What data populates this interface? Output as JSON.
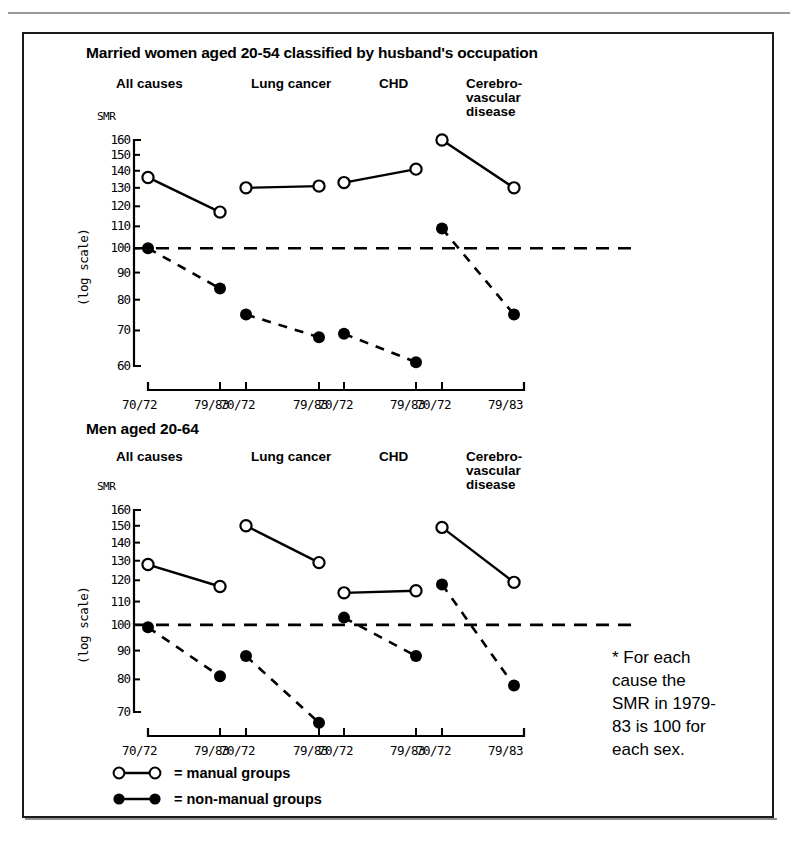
{
  "figure": {
    "footnote": "* For each\ncause the\nSMR in 1979-\n83 is 100 for\neach sex."
  },
  "legend": {
    "manual": "= manual groups",
    "non_manual": "= non-manual groups"
  },
  "axis": {
    "smr_label": "SMR",
    "log_scale_label": "(log scale)",
    "x_ticks": [
      "70/72",
      "79/83"
    ]
  },
  "chart_data": [
    {
      "type": "line",
      "title": "Married women aged 20-54 classified by husband's occupation",
      "xlabel": "",
      "ylabel": "SMR (log scale)",
      "yscale": "log",
      "ylim": [
        60,
        160
      ],
      "yticks": [
        60,
        70,
        80,
        90,
        100,
        110,
        120,
        130,
        140,
        150,
        160
      ],
      "grid": false,
      "reference_line": 100,
      "categories": [
        "All causes",
        "Lung cancer",
        "CHD",
        "Cerebro-vascular disease"
      ],
      "x": [
        "70/72",
        "79/83"
      ],
      "series": [
        {
          "name": "manual groups",
          "marker": "open-circle",
          "linestyle": "solid",
          "groups": [
            {
              "category": "All causes",
              "values": [
                136,
                117
              ]
            },
            {
              "category": "Lung cancer",
              "values": [
                130,
                131
              ]
            },
            {
              "category": "CHD",
              "values": [
                133,
                141
              ]
            },
            {
              "category": "Cerebro-vascular disease",
              "values": [
                160,
                130
              ]
            }
          ]
        },
        {
          "name": "non-manual groups",
          "marker": "filled-circle",
          "linestyle": "dashed",
          "groups": [
            {
              "category": "All causes",
              "values": [
                100,
                84
              ]
            },
            {
              "category": "Lung cancer",
              "values": [
                75,
                68
              ]
            },
            {
              "category": "CHD",
              "values": [
                69,
                61
              ]
            },
            {
              "category": "Cerebro-vascular disease",
              "values": [
                109,
                75
              ]
            }
          ]
        }
      ]
    },
    {
      "type": "line",
      "title": "Men aged 20-64",
      "xlabel": "",
      "ylabel": "SMR (log scale)",
      "yscale": "log",
      "ylim": [
        70,
        160
      ],
      "yticks": [
        70,
        80,
        90,
        100,
        110,
        120,
        130,
        140,
        150,
        160
      ],
      "grid": false,
      "reference_line": 100,
      "categories": [
        "All causes",
        "Lung cancer",
        "CHD",
        "Cerebro-vascular disease"
      ],
      "x": [
        "70/72",
        "79/83"
      ],
      "series": [
        {
          "name": "manual groups",
          "marker": "open-circle",
          "linestyle": "solid",
          "groups": [
            {
              "category": "All causes",
              "values": [
                128,
                117
              ]
            },
            {
              "category": "Lung cancer",
              "values": [
                150,
                129
              ]
            },
            {
              "category": "CHD",
              "values": [
                114,
                115
              ]
            },
            {
              "category": "Cerebro-vascular disease",
              "values": [
                149,
                119
              ]
            }
          ]
        },
        {
          "name": "non-manual groups",
          "marker": "filled-circle",
          "linestyle": "dashed",
          "groups": [
            {
              "category": "All causes",
              "values": [
                99,
                81
              ]
            },
            {
              "category": "Lung cancer",
              "values": [
                88,
                67
              ]
            },
            {
              "category": "CHD",
              "values": [
                103,
                88
              ]
            },
            {
              "category": "Cerebro-vascular disease",
              "values": [
                118,
                78
              ]
            }
          ]
        }
      ]
    }
  ]
}
